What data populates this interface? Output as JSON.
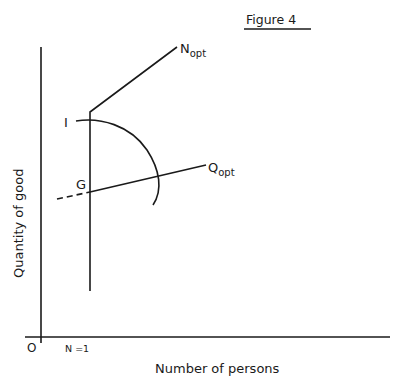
{
  "figure": {
    "title": "Figure 4",
    "x_axis_label": "Number of persons",
    "y_axis_label": "Quantity of good",
    "origin_label": "O",
    "x_tick_label": "N =1",
    "curves": {
      "n_opt": {
        "label": "N",
        "subscript": "opt"
      },
      "q_opt": {
        "label": "Q",
        "subscript": "opt"
      },
      "indifference": {
        "label": "I"
      },
      "point_g": {
        "label": "G"
      }
    }
  },
  "colors": {
    "ink": "#1a1a1a",
    "background": "#ffffff"
  }
}
